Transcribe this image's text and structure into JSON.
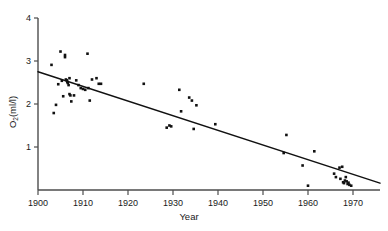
{
  "chart_data": {
    "type": "scatter",
    "title": "",
    "xlabel": "Year",
    "ylabel": "O2(ml/l)",
    "ylabel_base": "O",
    "ylabel_sub": "2",
    "ylabel_rest": "(ml/l)",
    "xlim": [
      1900,
      1976
    ],
    "ylim": [
      0,
      4
    ],
    "grid": false,
    "legend": null,
    "xticks": [
      1900,
      1910,
      1920,
      1930,
      1940,
      1950,
      1960,
      1970
    ],
    "xtick_labels": [
      "1900",
      "1910",
      "1920",
      "1930",
      "1940",
      "1950",
      "1960",
      "1970"
    ],
    "yticks": [
      1,
      2,
      3,
      4
    ],
    "ytick_labels": [
      "1",
      "2",
      "3",
      "4"
    ],
    "marker_color": "#111111",
    "axis_color": "#4d4d4d",
    "line_color": "#111111",
    "series": [
      {
        "name": "O2 measurements",
        "marker": "square",
        "x": [
          1903,
          1903.5,
          1904,
          1904.5,
          1905,
          1905.3,
          1905.6,
          1906,
          1906,
          1906.2,
          1906.4,
          1906.5,
          1906.6,
          1906.8,
          1907,
          1907,
          1907.2,
          1907.4,
          1908,
          1908.5,
          1909,
          1909.5,
          1910,
          1910.5,
          1911,
          1911.2,
          1911.5,
          1912,
          1913,
          1913.5,
          1914,
          1923.5,
          1928.6,
          1929.2,
          1929.6,
          1931.4,
          1931.8,
          1933.6,
          1934.2,
          1934.6,
          1935.2,
          1939.4,
          1954.6,
          1955.2,
          1958.8,
          1960,
          1961.4,
          1965.8,
          1966.2,
          1967,
          1967.2,
          1967.6,
          1967.8,
          1968,
          1968.2,
          1968.4,
          1968.6,
          1968.8,
          1969,
          1969.2,
          1969.6
        ],
        "y": [
          2.91,
          1.79,
          1.98,
          2.46,
          3.22,
          2.54,
          2.18,
          3.14,
          3.09,
          2.57,
          2.55,
          2.52,
          2.49,
          2.44,
          2.6,
          2.23,
          2.2,
          2.06,
          2.2,
          2.55,
          2.44,
          2.37,
          2.35,
          2.33,
          3.17,
          2.37,
          2.08,
          2.57,
          2.6,
          2.47,
          2.47,
          2.47,
          1.45,
          1.5,
          1.48,
          2.33,
          1.83,
          2.15,
          2.08,
          1.42,
          1.97,
          1.53,
          0.86,
          1.28,
          0.57,
          0.1,
          0.9,
          0.38,
          0.3,
          0.52,
          0.26,
          0.54,
          0.18,
          0.16,
          0.22,
          0.3,
          0.2,
          0.14,
          0.17,
          0.12,
          0.1
        ]
      }
    ],
    "fit_line": {
      "name": "linear regression",
      "x": [
        1900,
        1976
      ],
      "y": [
        2.75,
        0.16
      ]
    }
  },
  "figure": {
    "background": "#ffffff"
  }
}
